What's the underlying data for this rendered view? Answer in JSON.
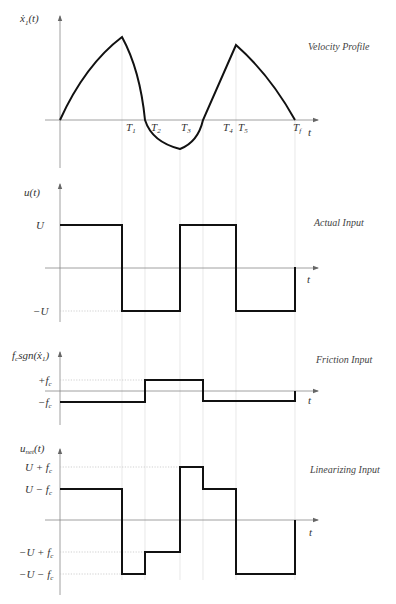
{
  "figure": {
    "time_marks": {
      "T1": 122,
      "T2": 145,
      "T3": 180,
      "T3b": 203,
      "T4": 224,
      "T5": 236,
      "Tf": 295
    },
    "time_labels": [
      "T_1",
      "T_2",
      "T_3",
      "T_4",
      "T_5",
      "T_f"
    ],
    "panels": [
      {
        "id": "velocity",
        "title": "Velocity Profile",
        "ylabel": "ẋ₁(t)",
        "xlabel": "t",
        "tick_labels": [
          "T₁",
          "T₂",
          "T₃",
          "T₄",
          "T₅",
          "T_f"
        ]
      },
      {
        "id": "actual_input",
        "title": "Actual Input",
        "ylabel": "u(t)",
        "xlabel": "t",
        "levels": [
          "U",
          "−U"
        ]
      },
      {
        "id": "friction_input",
        "title": "Friction Input",
        "ylabel": "f_c sgn(ẋ₁)",
        "xlabel": "t",
        "levels": [
          "+f_c",
          "−f_c"
        ]
      },
      {
        "id": "linearizing_input",
        "title": "Linearizing Input",
        "ylabel": "u_net(t)",
        "xlabel": "t",
        "levels": [
          "U + f_c",
          "U − f_c",
          "−U + f_c",
          "−U − f_c"
        ]
      }
    ]
  },
  "labels": {
    "p1_title": "Velocity Profile",
    "p1_y": "ẋ",
    "p1_y_sub": "1",
    "p1_y_rest": "(t)",
    "t1": "T",
    "t1s": "1",
    "t2": "T",
    "t2s": "2",
    "t3": "T",
    "t3s": "3",
    "t4": "T",
    "t4s": "4",
    "t5": "T",
    "t5s": "5",
    "tf": "T",
    "tfs": "f",
    "t": "t",
    "p2_title": "Actual Input",
    "p2_y": "u(t)",
    "U": "U",
    "mU": "−U",
    "p3_title": "Friction Input",
    "p3_y_f": "f",
    "p3_y_c": "c",
    "p3_y_rest": "sgn(ẋ",
    "p3_y_1": "1",
    "p3_y_close": ")",
    "pfc": "+f",
    "mfc": "−f",
    "c": "c",
    "p4_title": "Linearizing Input",
    "p4_y": "u",
    "p4_y_sub": "net",
    "p4_y_rest": "(t)",
    "Upfc": "U + f",
    "Umfc": "U − f",
    "mUpfc": "−U + f",
    "mUmfc": "−U − f"
  }
}
